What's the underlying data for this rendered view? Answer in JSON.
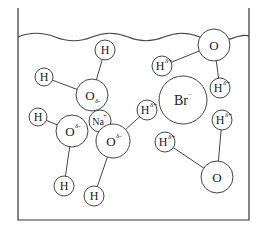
{
  "diagram": {
    "title": "",
    "container": {
      "left": 18,
      "right": 249,
      "top": 8,
      "bottom": 220
    },
    "surface_label": "",
    "atoms": [
      {
        "id": "h1",
        "label": "H",
        "charge": "",
        "cx": 105,
        "cy": 50,
        "r": 10
      },
      {
        "id": "h2",
        "label": "H",
        "charge": "",
        "cx": 44,
        "cy": 77,
        "r": 9
      },
      {
        "id": "o1",
        "label": "O",
        "charge": "δ-",
        "cx": 92,
        "cy": 95,
        "r": 16
      },
      {
        "id": "h3",
        "label": "H",
        "charge": "",
        "cx": 38,
        "cy": 117,
        "r": 9
      },
      {
        "id": "o2",
        "label": "O",
        "charge": "δ-",
        "cx": 72,
        "cy": 131,
        "r": 16
      },
      {
        "id": "na",
        "label": "Na",
        "charge": "+",
        "cx": 100,
        "cy": 121,
        "r": 11
      },
      {
        "id": "o3",
        "label": "O",
        "charge": "δ-",
        "cx": 113,
        "cy": 141,
        "r": 17
      },
      {
        "id": "h4",
        "label": "H",
        "charge": "",
        "cx": 64,
        "cy": 186,
        "r": 10
      },
      {
        "id": "h5",
        "label": "H",
        "charge": "",
        "cx": 94,
        "cy": 196,
        "r": 10
      },
      {
        "id": "h6",
        "label": "H",
        "charge": "δ+",
        "cx": 147,
        "cy": 110,
        "r": 10
      },
      {
        "id": "br",
        "label": "Br",
        "charge": "−",
        "cx": 183,
        "cy": 100,
        "r": 24
      },
      {
        "id": "h7",
        "label": "H",
        "charge": "δ+",
        "cx": 162,
        "cy": 66,
        "r": 10
      },
      {
        "id": "o4",
        "label": "O",
        "charge": "",
        "cx": 214,
        "cy": 45,
        "r": 16
      },
      {
        "id": "h8",
        "label": "H",
        "charge": "δ+",
        "cx": 220,
        "cy": 88,
        "r": 10
      },
      {
        "id": "h9",
        "label": "H",
        "charge": "δ+",
        "cx": 222,
        "cy": 120,
        "r": 10
      },
      {
        "id": "h10",
        "label": "H",
        "charge": "δ+",
        "cx": 165,
        "cy": 142,
        "r": 10
      },
      {
        "id": "o5",
        "label": "O",
        "charge": "",
        "cx": 217,
        "cy": 177,
        "r": 16
      }
    ],
    "bonds": [
      [
        "o1",
        "h1"
      ],
      [
        "o1",
        "h2"
      ],
      [
        "o2",
        "h3"
      ],
      [
        "o2",
        "h4"
      ],
      [
        "o3",
        "h5"
      ],
      [
        "o3",
        "h6"
      ],
      [
        "o4",
        "h7"
      ],
      [
        "o4",
        "h8"
      ],
      [
        "o5",
        "h9"
      ],
      [
        "o5",
        "h10"
      ]
    ]
  }
}
